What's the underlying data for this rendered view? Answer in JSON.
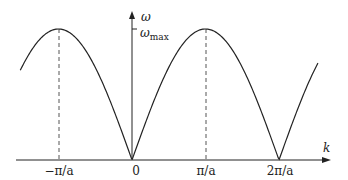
{
  "figure": {
    "axes": {
      "x_label": "k",
      "y_label": "ω",
      "y_tick_label": "ω",
      "y_tick_sub": "max"
    },
    "x_ticks": [
      {
        "label": "−π/a",
        "value": -1
      },
      {
        "label": "0",
        "value": 0
      },
      {
        "label": "π/a",
        "value": 1
      },
      {
        "label": "2π/a",
        "value": 2
      }
    ],
    "curve": "ω = ω_max |sin(ka/2)|",
    "k_range_in_pi_over_a": [
      -1.52,
      2.53
    ],
    "colors": {
      "curve": "#222222",
      "axes": "#222222",
      "dashed": "#555555"
    }
  }
}
